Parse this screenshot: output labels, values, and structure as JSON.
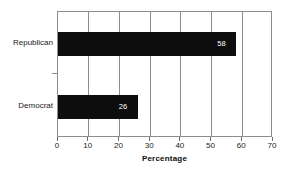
{
  "chart_data": {
    "type": "bar",
    "orientation": "horizontal",
    "title": "",
    "subtitle": "",
    "xlabel": "Percentage",
    "ylabel": "",
    "categories": [
      "Republican",
      "Democrat"
    ],
    "values": [
      58,
      26
    ],
    "data_labels": [
      "58",
      "26"
    ],
    "xlim": [
      0,
      70
    ],
    "xticks": [
      0,
      10,
      20,
      30,
      40,
      50,
      60,
      70
    ],
    "xtick_labels": [
      "0",
      "10",
      "20",
      "30",
      "40",
      "50",
      "60",
      "70"
    ],
    "grid": {
      "vertical": true,
      "horizontal": false
    },
    "legend": null,
    "bar_color": "#0d0d0d",
    "data_label_color": "#ffffff",
    "frame_color": "#8d8d8d",
    "background": "#ffffff"
  }
}
